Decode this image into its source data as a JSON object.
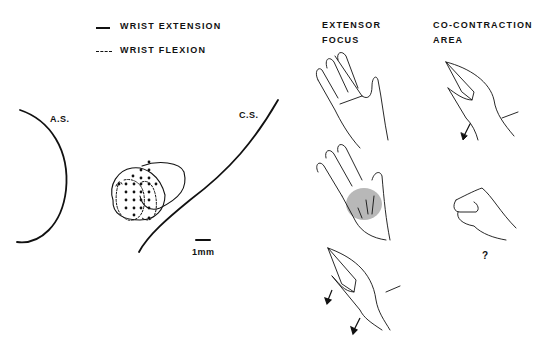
{
  "legend": {
    "items": [
      {
        "style": "solid",
        "label": "WRIST EXTENSION"
      },
      {
        "style": "dashed",
        "label": "WRIST FLEXION"
      }
    ]
  },
  "cortex_map": {
    "left_label": "A.S.",
    "right_label": "C.S.",
    "scale_bar_label": "1mm"
  },
  "columns": {
    "extensor": {
      "line1": "EXTENSOR",
      "line2": "FOCUS"
    },
    "cocontraction": {
      "line1": "CO-CONTRACTION",
      "line2": "AREA"
    }
  },
  "cocontraction_question": "?",
  "colors": {
    "ink": "#111111",
    "shade": "#9a9a9a",
    "background": "#ffffff"
  }
}
